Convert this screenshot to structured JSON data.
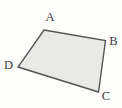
{
  "figure": {
    "background_color": "#fdfdfc",
    "shape": {
      "type": "quadrilateral",
      "fill_color": "#e9e9e7",
      "stroke_color": "#555555",
      "stroke_width": 1.4,
      "vertices": [
        {
          "label": "A",
          "x": 44,
          "y": 30,
          "label_x": 50,
          "label_y": 21
        },
        {
          "label": "B",
          "x": 105.5,
          "y": 40.5,
          "label_x": 113.5,
          "label_y": 44.5
        },
        {
          "label": "C",
          "x": 98.5,
          "y": 92,
          "label_x": 106,
          "label_y": 100
        },
        {
          "label": "D",
          "x": 18,
          "y": 67,
          "label_x": 8.5,
          "label_y": 68.5
        }
      ]
    }
  }
}
